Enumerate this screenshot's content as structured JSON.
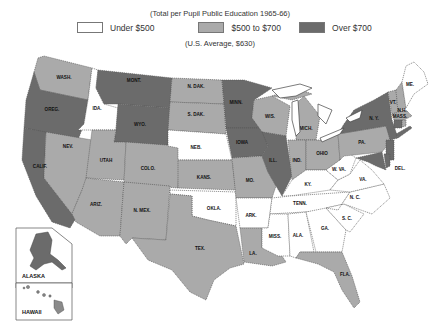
{
  "header": {
    "subtitle": "(Total per Pupil Public Education 1965-66)",
    "average": "(U.S. Average, $630)"
  },
  "legend": [
    {
      "label": "Under $500",
      "color": "#ffffff"
    },
    {
      "label": "$500 to $700",
      "color": "#aaaaaa"
    },
    {
      "label": "Over $700",
      "color": "#6b6b6b"
    }
  ],
  "colors": {
    "low": "#ffffff",
    "mid": "#aaaaaa",
    "high": "#6b6b6b",
    "border": "#555555"
  },
  "states": {
    "wash": {
      "label": "WASH.",
      "category": "mid"
    },
    "oreg": {
      "label": "OREG.",
      "category": "high"
    },
    "calif": {
      "label": "CALIF.",
      "category": "high"
    },
    "ida": {
      "label": "IDA.",
      "category": "low"
    },
    "nev": {
      "label": "NEV.",
      "category": "mid"
    },
    "mont": {
      "label": "MONT.",
      "category": "high"
    },
    "wyo": {
      "label": "WYO.",
      "category": "high"
    },
    "utah": {
      "label": "UTAH",
      "category": "mid"
    },
    "ariz": {
      "label": "ARIZ.",
      "category": "mid"
    },
    "colo": {
      "label": "COLO.",
      "category": "mid"
    },
    "nmex": {
      "label": "N. MEX.",
      "category": "mid"
    },
    "ndak": {
      "label": "N. DAK.",
      "category": "mid"
    },
    "sdak": {
      "label": "S. DAK.",
      "category": "mid"
    },
    "neb": {
      "label": "NEB.",
      "category": "low"
    },
    "kans": {
      "label": "KANS.",
      "category": "mid"
    },
    "okla": {
      "label": "OKLA.",
      "category": "low"
    },
    "tex": {
      "label": "TEX.",
      "category": "mid"
    },
    "minn": {
      "label": "MINN.",
      "category": "high"
    },
    "iowa": {
      "label": "IOWA",
      "category": "high"
    },
    "mo": {
      "label": "MO.",
      "category": "mid"
    },
    "ark": {
      "label": "ARK.",
      "category": "low"
    },
    "la": {
      "label": "LA.",
      "category": "mid"
    },
    "wis": {
      "label": "WIS.",
      "category": "mid"
    },
    "ill": {
      "label": "ILL.",
      "category": "high"
    },
    "mich": {
      "label": "MICH.",
      "category": "mid"
    },
    "ind": {
      "label": "IND.",
      "category": "mid"
    },
    "ohio": {
      "label": "OHIO",
      "category": "mid"
    },
    "ky": {
      "label": "KY.",
      "category": "low"
    },
    "tenn": {
      "label": "TENN.",
      "category": "low"
    },
    "miss": {
      "label": "MISS.",
      "category": "low"
    },
    "ala": {
      "label": "ALA.",
      "category": "low"
    },
    "ga": {
      "label": "GA.",
      "category": "low"
    },
    "fla": {
      "label": "FLA.",
      "category": "mid"
    },
    "sc": {
      "label": "S. C.",
      "category": "low"
    },
    "nc": {
      "label": "N. C.",
      "category": "low"
    },
    "va": {
      "label": "VA.",
      "category": "low"
    },
    "wva": {
      "label": "W. VA.",
      "category": "low"
    },
    "pa": {
      "label": "PA.",
      "category": "mid"
    },
    "ny": {
      "label": "N. Y.",
      "category": "high"
    },
    "vt": {
      "label": "VT.",
      "category": "mid"
    },
    "nh": {
      "label": "N.H.",
      "category": "mid"
    },
    "me": {
      "label": "ME.",
      "category": "low"
    },
    "mass": {
      "label": "MASS.",
      "category": "mid"
    },
    "ri": {
      "label": "R.I.",
      "category": "mid"
    },
    "conn": {
      "label": "CONN.",
      "category": "high"
    },
    "nj": {
      "label": "N.J.",
      "category": "high"
    },
    "del": {
      "label": "DEL.",
      "category": "high"
    },
    "md": {
      "label": "MD.",
      "category": "high"
    },
    "alaska": {
      "label": "ALASKA",
      "category": "high"
    },
    "hawaii": {
      "label": "HAWAII",
      "category": "mid"
    }
  }
}
